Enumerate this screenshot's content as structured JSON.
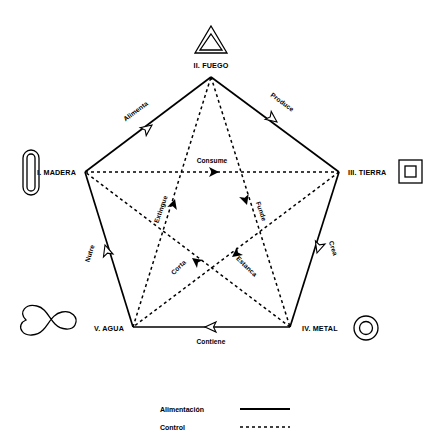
{
  "diagram": {
    "nodes": [
      {
        "id": "fuego",
        "label": "II. FUEGO",
        "icon": "triangle-icon",
        "x": 211,
        "y": 77,
        "label_x": 211,
        "label_y": 68,
        "icon_x": 211,
        "icon_y": 40
      },
      {
        "id": "tierra",
        "label": "III. TIERRA",
        "icon": "square-icon",
        "x": 339,
        "y": 172,
        "label_x": 366,
        "label_y": 174,
        "icon_x": 410,
        "icon_y": 171
      },
      {
        "id": "metal",
        "label": "IV. METAL",
        "icon": "circle-icon",
        "x": 290,
        "y": 327,
        "label_x": 324,
        "label_y": 330,
        "icon_x": 366,
        "icon_y": 328
      },
      {
        "id": "agua",
        "label": "V. AGUA",
        "icon": "wave-icon",
        "x": 133,
        "y": 327,
        "label_x": 107,
        "label_y": 330,
        "icon_x": 50,
        "icon_y": 328
      },
      {
        "id": "madera",
        "label": "I. MADERA",
        "icon": "rounded-bar-icon",
        "x": 85,
        "y": 172,
        "label_x": 60,
        "label_y": 174,
        "icon_x": 31,
        "icon_y": 172
      }
    ],
    "generating_cycle": {
      "name": "Alimentación",
      "style": "solid",
      "edges": [
        {
          "id": "madera-fuego",
          "label": "Alimenta",
          "from": "madera",
          "to": "fuego",
          "label_x": 137,
          "label_y": 113,
          "rotation": -36.5
        },
        {
          "id": "fuego-tierra",
          "label": "Produce",
          "from": "fuego",
          "to": "tierra",
          "label_x": 280,
          "label_y": 105,
          "rotation": 36.5
        },
        {
          "id": "tierra-metal",
          "label": "Crea",
          "from": "tierra",
          "to": "metal",
          "label_x": 329,
          "label_y": 248,
          "rotation": 72
        },
        {
          "id": "metal-agua",
          "label": "Contiene",
          "from": "metal",
          "to": "agua",
          "label_x": 211,
          "label_y": 343,
          "rotation": 0
        },
        {
          "id": "agua-madera",
          "label": "Nutre",
          "from": "agua",
          "to": "madera",
          "label_x": 93,
          "label_y": 253,
          "rotation": -72
        }
      ]
    },
    "controlling_cycle": {
      "name": "Control",
      "style": "dashed",
      "edges": [
        {
          "id": "madera-tierra",
          "label": "Consume",
          "from": "madera",
          "to": "tierra",
          "label_x": 212,
          "label_y": 163,
          "rotation": 0
        },
        {
          "id": "tierra-agua",
          "label": "Estanca",
          "from": "tierra",
          "to": "agua",
          "label_x": 243,
          "label_y": 267,
          "rotation": 44
        },
        {
          "id": "agua-fuego",
          "label": "Extingue",
          "from": "agua",
          "to": "fuego",
          "label_x": 163,
          "label_y": 209,
          "rotation": -71
        },
        {
          "id": "fuego-metal",
          "label": "Funde",
          "from": "fuego",
          "to": "metal",
          "label_x": 258,
          "label_y": 212,
          "rotation": 71
        },
        {
          "id": "metal-madera",
          "label": "Corta",
          "from": "metal",
          "to": "madera",
          "label_x": 180,
          "label_y": 268,
          "rotation": -44
        }
      ]
    },
    "legend": {
      "items": [
        {
          "label": "Alimentación",
          "style": "solid"
        },
        {
          "label": "Control",
          "style": "dashed"
        }
      ]
    }
  }
}
